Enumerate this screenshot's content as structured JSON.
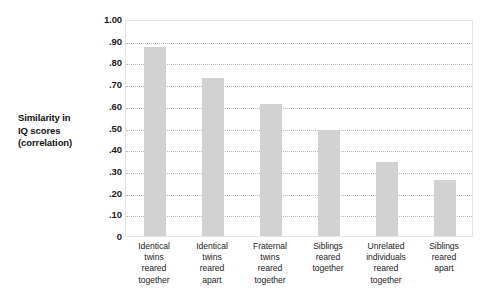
{
  "chart_data": {
    "type": "bar",
    "title": "",
    "subtitle": "",
    "xlabel": "",
    "ylabel": "Similarity in IQ scores (correlation)",
    "ylim": [
      0,
      1.0
    ],
    "ytick_values": [
      1.0,
      0.9,
      0.8,
      0.7,
      0.6,
      0.5,
      0.4,
      0.3,
      0.2,
      0.1,
      0
    ],
    "ytick_labels": [
      "1.00",
      ".90",
      ".80",
      ".70",
      ".60",
      ".50",
      ".40",
      ".30",
      ".20",
      ".10",
      "0"
    ],
    "grid": true,
    "grid_style": "dotted-horizontal",
    "legend": false,
    "bar_color": "#d2d2d2",
    "categories": [
      "Identical twins reared together",
      "Identical twins reared apart",
      "Fraternal twins reared together",
      "Siblings reared together",
      "Unrelated individuals reared together",
      "Siblings reared apart"
    ],
    "category_lines": [
      [
        "Identical",
        "twins",
        "reared",
        "together"
      ],
      [
        "Identical",
        "twins",
        "reared",
        "apart"
      ],
      [
        "Fraternal",
        "twins",
        "reared",
        "together"
      ],
      [
        "Siblings",
        "reared",
        "together"
      ],
      [
        "Unrelated",
        "individuals",
        "reared",
        "together"
      ],
      [
        "Siblings",
        "reared",
        "apart"
      ]
    ],
    "values": [
      0.87,
      0.73,
      0.61,
      0.49,
      0.34,
      0.26
    ]
  },
  "axis_title": {
    "line1": "Similarity in",
    "line2": "IQ scores",
    "line3": "(correlation)"
  }
}
